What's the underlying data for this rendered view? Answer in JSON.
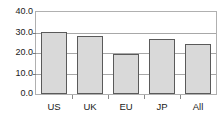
{
  "chart_data": {
    "type": "bar",
    "title": "",
    "subtitle": "",
    "xlabel": "",
    "ylabel": "",
    "categories": [
      "US",
      "UK",
      "EU",
      "JP",
      "All"
    ],
    "values": [
      30.2,
      28.3,
      19.7,
      27.0,
      24.5
    ],
    "series": [
      {
        "name": "",
        "values": [
          30.2,
          28.3,
          19.7,
          27.0,
          24.5
        ]
      }
    ],
    "ylim": [
      0.0,
      40.0
    ],
    "ytick_values": [
      0.0,
      10.0,
      20.0,
      30.0,
      40.0
    ],
    "ytick_labels": [
      "0.0",
      "10.0",
      "20.0",
      "30.0",
      "40.0"
    ],
    "grid": true,
    "grid_axis": "y",
    "legend": false,
    "legend_position": "none",
    "annotations": [],
    "colors": {
      "bar_fill": "#d9d9d9",
      "bar_edge": "#5a5a5a",
      "grid": "#a8a8a8",
      "frame": "#b0b0b0",
      "text": "#1a1a1a",
      "background": "#ffffff"
    }
  }
}
